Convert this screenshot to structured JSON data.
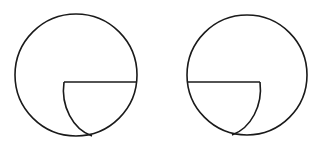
{
  "canvas": {
    "width": 323,
    "height": 144,
    "background": "#ffffff"
  },
  "stroke": {
    "color": "#1a1a1a",
    "width": 1.6
  },
  "figures": [
    {
      "name": "left-figure",
      "circle": {
        "cx": 76,
        "cy": 75,
        "r": 61
      },
      "chord": {
        "x1": 64,
        "y1": 82,
        "x2": 136,
        "y2": 82
      },
      "inner_arc": {
        "start": [
          64,
          82
        ],
        "end": [
          92,
          136
        ],
        "rx": 40,
        "ry": 48,
        "sweep": 0
      }
    },
    {
      "name": "right-figure",
      "circle": {
        "cx": 247,
        "cy": 75,
        "r": 60
      },
      "chord": {
        "x1": 187,
        "y1": 82,
        "x2": 260,
        "y2": 82
      },
      "inner_arc": {
        "start": [
          260,
          82
        ],
        "end": [
          232,
          135
        ],
        "rx": 40,
        "ry": 48,
        "sweep": 1
      }
    }
  ]
}
